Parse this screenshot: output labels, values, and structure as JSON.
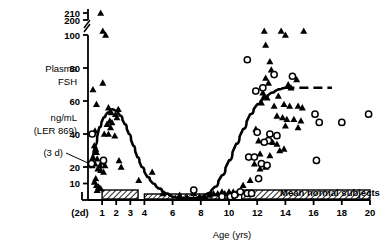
{
  "chart_data": {
    "type": "scatter",
    "title": "",
    "xlabel": "Age (yrs)",
    "ylabel": "Plasma FSH",
    "ylabel_units": "ng/mL",
    "ylabel_standard": "(LER 869)",
    "xlim": [
      0,
      20
    ],
    "ylim": [
      0,
      210
    ],
    "grid": false,
    "legend_position": "none",
    "axis_break": {
      "between": [
        200,
        100
      ],
      "note": "y-axis broken between 100 and 200"
    },
    "yticks": [
      10,
      20,
      40,
      60,
      80,
      100,
      200,
      210
    ],
    "ytick_labels": [
      "10",
      "20",
      "40",
      "60",
      "80",
      "100",
      "200",
      "210"
    ],
    "xticks": [
      1,
      2,
      3,
      4,
      6,
      8,
      10,
      12,
      14,
      16,
      18,
      20
    ],
    "xtick_labels": [
      "1",
      "2",
      "3",
      "4",
      "6",
      "8",
      "10",
      "12",
      "14",
      "16",
      "18",
      "20"
    ],
    "annotations": [
      {
        "text": "(2d)",
        "x": 0.1,
        "y": -18,
        "note": "2 days of age, left of axis origin"
      },
      {
        "text": "(3 d)",
        "x": -1.4,
        "y": 24,
        "note": "3 days of age, leader line to point near 22"
      },
      {
        "text": "Mean normal subjects",
        "x": 15.4,
        "y": 6,
        "note": "label above right hatched bar"
      }
    ],
    "bars": [
      {
        "name": "hatched-bar-infancy",
        "x_start": 1.0,
        "x_end": 3.55,
        "height": "tall",
        "hatch": "diagonal"
      },
      {
        "name": "hatched-bar-childhood",
        "x_start": 4.0,
        "x_end": 10.4,
        "height": "short",
        "hatch": "diagonal"
      },
      {
        "name": "hatched-bar-normal",
        "x_start": 10.9,
        "x_end": 20.0,
        "height": "tall",
        "hatch": "diagonal"
      }
    ],
    "series": [
      {
        "name": "filled-triangle",
        "marker": "triangle",
        "fill": "#000000",
        "points": [
          [
            0.9,
            210
          ],
          [
            1.05,
            101
          ],
          [
            1.25,
            100
          ],
          [
            1.05,
            71
          ],
          [
            0.35,
            67
          ],
          [
            0.6,
            58
          ],
          [
            1.45,
            56
          ],
          [
            2.15,
            55
          ],
          [
            1.65,
            53
          ],
          [
            1.95,
            52
          ],
          [
            2.05,
            50
          ],
          [
            1.55,
            48
          ],
          [
            1.7,
            47
          ],
          [
            1.35,
            46
          ],
          [
            1.6,
            44
          ],
          [
            0.5,
            42
          ],
          [
            1.15,
            40
          ],
          [
            1.45,
            40
          ],
          [
            1.9,
            39
          ],
          [
            0.45,
            33
          ],
          [
            0.55,
            31
          ],
          [
            0.6,
            29
          ],
          [
            0.35,
            26
          ],
          [
            0.65,
            25
          ],
          [
            2.2,
            24
          ],
          [
            1.0,
            23
          ],
          [
            0.5,
            22
          ],
          [
            0.3,
            21
          ],
          [
            0.85,
            21
          ],
          [
            1.2,
            21
          ],
          [
            2.35,
            20
          ],
          [
            0.7,
            19
          ],
          [
            0.9,
            18
          ],
          [
            1.1,
            17
          ],
          [
            4.55,
            17
          ],
          [
            0.55,
            13
          ],
          [
            3.6,
            12
          ],
          [
            0.45,
            11
          ],
          [
            0.6,
            9
          ],
          [
            0.75,
            8
          ],
          [
            0.9,
            7
          ],
          [
            0.65,
            6
          ],
          [
            5.3,
            4
          ],
          [
            6.5,
            3
          ],
          [
            7.0,
            2
          ],
          [
            7.5,
            4
          ],
          [
            7.9,
            2
          ],
          [
            8.3,
            2
          ],
          [
            8.6,
            3
          ],
          [
            8.9,
            4
          ],
          [
            9.2,
            4
          ],
          [
            9.5,
            5
          ],
          [
            9.7,
            4
          ],
          [
            10.0,
            5
          ],
          [
            10.3,
            5
          ],
          [
            10.5,
            4
          ],
          [
            12.5,
            101
          ],
          [
            13.7,
            101
          ],
          [
            14.0,
            100
          ],
          [
            15.3,
            103
          ],
          [
            12.6,
            94
          ],
          [
            12.9,
            84
          ],
          [
            13.0,
            79
          ],
          [
            12.6,
            74
          ],
          [
            12.8,
            71
          ],
          [
            14.6,
            75
          ],
          [
            14.8,
            73
          ],
          [
            12.4,
            65
          ],
          [
            12.5,
            63
          ],
          [
            12.7,
            62
          ],
          [
            13.5,
            63
          ],
          [
            14.2,
            70
          ],
          [
            14.4,
            68
          ],
          [
            12.3,
            59
          ],
          [
            13.2,
            57
          ],
          [
            13.9,
            58
          ],
          [
            14.3,
            57
          ],
          [
            14.9,
            57
          ],
          [
            15.2,
            56
          ],
          [
            13.4,
            51
          ],
          [
            13.8,
            50
          ],
          [
            14.1,
            49
          ],
          [
            14.6,
            49
          ],
          [
            15.1,
            48
          ],
          [
            11.9,
            43
          ],
          [
            14.0,
            45
          ],
          [
            14.9,
            44
          ],
          [
            12.1,
            36
          ],
          [
            13.1,
            35
          ],
          [
            13.4,
            34
          ],
          [
            13.9,
            31
          ],
          [
            12.2,
            28
          ],
          [
            12.9,
            27
          ],
          [
            13.6,
            30
          ],
          [
            11.8,
            22
          ],
          [
            12.6,
            20
          ],
          [
            12.2,
            19
          ],
          [
            11.5,
            12
          ],
          [
            11.0,
            9
          ]
        ]
      },
      {
        "name": "open-circle",
        "marker": "circle",
        "fill": "none",
        "stroke": "#000000",
        "points": [
          [
            0.3,
            40
          ],
          [
            0.25,
            22
          ],
          [
            1.1,
            24
          ],
          [
            7.5,
            6
          ],
          [
            9.5,
            2
          ],
          [
            10.1,
            2
          ],
          [
            10.4,
            3
          ],
          [
            10.8,
            5
          ],
          [
            11.3,
            4
          ],
          [
            11.6,
            4
          ],
          [
            11.3,
            85
          ],
          [
            13.2,
            76
          ],
          [
            14.5,
            75
          ],
          [
            12.4,
            68
          ],
          [
            11.9,
            66
          ],
          [
            12.0,
            41
          ],
          [
            12.9,
            40
          ],
          [
            13.4,
            39
          ],
          [
            12.8,
            36
          ],
          [
            12.5,
            35
          ],
          [
            11.4,
            26
          ],
          [
            11.8,
            26
          ],
          [
            12.3,
            22
          ],
          [
            12.7,
            21
          ],
          [
            12.1,
            13
          ],
          [
            16.1,
            52
          ],
          [
            16.4,
            47
          ],
          [
            18.0,
            47
          ],
          [
            19.9,
            52
          ],
          [
            16.2,
            24
          ]
        ]
      }
    ],
    "fitted_curve": {
      "name": "mean-fitted-curve",
      "style": "solid-with-dashed-plateau",
      "description": "Biphasic curve: neonatal/infancy FSH surge peaking near age 1.7 yrs at ~55 ng/mL, declining to childhood nadir near 0 at ages 6.5-8, then pubertal rise from age 9 to adult plateau ~68 ng/mL at age 14 onward (dashed beyond 15).",
      "points": [
        [
          0.2,
          20
        ],
        [
          0.5,
          33
        ],
        [
          0.8,
          44
        ],
        [
          1.1,
          50
        ],
        [
          1.4,
          53
        ],
        [
          1.7,
          55
        ],
        [
          2.0,
          54
        ],
        [
          2.3,
          51
        ],
        [
          2.6,
          46
        ],
        [
          2.9,
          40
        ],
        [
          3.2,
          33
        ],
        [
          3.5,
          26
        ],
        [
          3.8,
          20
        ],
        [
          4.2,
          14
        ],
        [
          4.6,
          10
        ],
        [
          5.0,
          7
        ],
        [
          5.5,
          4
        ],
        [
          6.0,
          2
        ],
        [
          6.5,
          1
        ],
        [
          7.0,
          1
        ],
        [
          7.5,
          1
        ],
        [
          8.0,
          2
        ],
        [
          8.5,
          4
        ],
        [
          9.0,
          8
        ],
        [
          9.5,
          15
        ],
        [
          10.0,
          24
        ],
        [
          10.5,
          34
        ],
        [
          11.0,
          43
        ],
        [
          11.5,
          52
        ],
        [
          12.0,
          58
        ],
        [
          12.5,
          62
        ],
        [
          13.0,
          65
        ],
        [
          13.5,
          67
        ],
        [
          14.0,
          68
        ]
      ],
      "dashed_from_x": 14.0,
      "dashed_to_x": 17.3,
      "plateau_value": 68
    }
  },
  "labels": {
    "y_title_line1": "Plasma",
    "y_title_line2": "FSH",
    "y_units_line1": "ng/mL",
    "y_units_line2": "(LER 869)",
    "three_days": "(3 d)",
    "two_days": "(2d)",
    "x_title": "Age (yrs)",
    "normal_bar": "Mean normal subjects"
  },
  "colors": {
    "ink": "#000000",
    "background": "#ffffff"
  }
}
